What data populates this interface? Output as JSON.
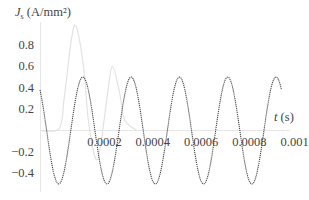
{
  "chart_data": {
    "type": "line",
    "title": "",
    "xlabel": "t (s)",
    "ylabel": "J_s (A/mm²)",
    "xlim": [
      0,
      0.001
    ],
    "ylim": [
      -0.5,
      1.0
    ],
    "grid": false,
    "legend": null,
    "x_ticks": [
      {
        "value": 0.0002,
        "label": "0.0002"
      },
      {
        "value": 0.0004,
        "label": "0.0004"
      },
      {
        "value": 0.0006,
        "label": "0.0006"
      },
      {
        "value": 0.0008,
        "label": "0.0008"
      },
      {
        "value": 0.001,
        "label": "0.001"
      }
    ],
    "y_ticks": [
      {
        "value": 0.8,
        "label": "0.8"
      },
      {
        "value": 0.6,
        "label": "0.6"
      },
      {
        "value": 0.4,
        "label": "0.4"
      },
      {
        "value": 0.2,
        "label": "0.2"
      },
      {
        "value": -0.2,
        "label": "-0.2"
      },
      {
        "value": -0.4,
        "label": "-0.4"
      }
    ],
    "series": [
      {
        "name": "steady-state",
        "color": "#444444",
        "style": "dotted",
        "x": [
          0,
          5e-05,
          0.0001,
          0.00015,
          0.00018,
          0.0002,
          0.00025,
          0.0003,
          0.00035,
          0.00038,
          0.0004,
          0.00045,
          0.0005,
          0.00055,
          0.00058,
          0.0006,
          0.00065,
          0.0007,
          0.00075,
          0.00078,
          0.0008,
          0.00085,
          0.0009,
          0.00095,
          0.00098,
          0.001
        ],
        "values": [
          0.38,
          -0.33,
          -0.38,
          0.33,
          0.5,
          0.38,
          -0.33,
          -0.38,
          0.33,
          0.5,
          0.38,
          -0.33,
          -0.38,
          0.33,
          0.5,
          0.38,
          -0.33,
          -0.38,
          0.33,
          0.5,
          0.38,
          -0.33,
          -0.38,
          0.33,
          0.5,
          0.38
        ]
      },
      {
        "name": "transient",
        "color": "#e4e4e4",
        "style": "solid",
        "x": [
          0,
          8e-05,
          0.0001,
          0.00013,
          0.00015,
          0.00018,
          0.0002,
          0.00023,
          0.00025,
          0.00028,
          0.0003,
          0.00033,
          0.00035,
          0.0004
        ],
        "values": [
          0.0,
          0.02,
          0.3,
          0.85,
          0.97,
          0.6,
          0.1,
          -0.26,
          -0.15,
          0.35,
          0.6,
          0.35,
          0.1,
          0.0
        ]
      }
    ],
    "formula": {
      "steady_state": "0.5*sin(2*pi*5000*t + 2.28)"
    }
  },
  "labels": {
    "y_axis_symbol": "J",
    "y_axis_sub": "s",
    "y_axis_unit": " (A/mm²)",
    "x_axis_symbol": "t",
    "x_axis_unit": " (s)"
  }
}
